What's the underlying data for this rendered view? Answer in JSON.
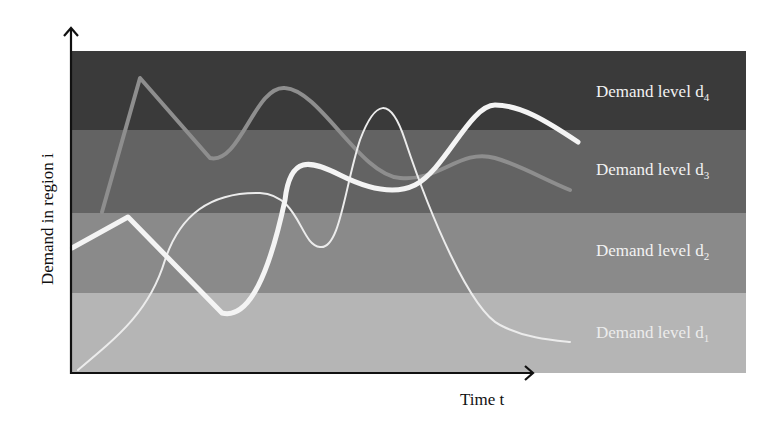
{
  "chart_data": {
    "type": "line",
    "title": "",
    "xlabel": "Time t",
    "ylabel": "Demand in region i",
    "grid": false,
    "legend": "none (bands labeled inline on right)",
    "bands": [
      {
        "id": "d4",
        "label": "Demand level",
        "sub": "4",
        "color": "#3a3a3a",
        "y_top": 51,
        "y_bottom": 130
      },
      {
        "id": "d3",
        "label": "Demand level",
        "sub": "3",
        "color": "#626262",
        "y_top": 130,
        "y_bottom": 213
      },
      {
        "id": "d2",
        "label": "Demand level",
        "sub": "2",
        "color": "#8a8a8a",
        "y_top": 213,
        "y_bottom": 293
      },
      {
        "id": "d1",
        "label": "Demand level",
        "sub": "1",
        "color": "#b4b4b4",
        "y_top": 293,
        "y_bottom": 373
      }
    ],
    "series": [
      {
        "name": "thick-white-curve",
        "stroke": "#f4f4f4",
        "width": 5,
        "path": "M72,248 L128,217 L222,313 C250,320 270,270 285,200 C290,155 310,160 340,175 C370,190 395,195 415,185 C445,170 470,105 495,105 C520,105 545,120 578,142"
      },
      {
        "name": "medium-gray-curve",
        "stroke": "#8e8e8e",
        "width": 4,
        "path": "M102,212 L140,78 L210,158 C240,165 255,85 285,88 C320,90 360,175 400,178 C440,182 460,148 495,158 C520,165 545,180 570,190"
      },
      {
        "name": "thin-white-curve-a",
        "stroke": "#ececec",
        "width": 2,
        "path": "M78,370 C120,335 150,310 165,260 C180,215 210,192 260,193 C300,195 300,245 320,247 C340,250 345,185 360,140 C375,100 390,95 405,140 C430,215 470,310 500,325 C525,338 550,340 570,342"
      }
    ],
    "axes": {
      "x_arrow_end": 535,
      "y_arrow_top": 28
    }
  },
  "labels": {
    "d4": "Demand level d",
    "d4_sub": "4",
    "d3": "Demand level d",
    "d3_sub": "3",
    "d2": "Demand level d",
    "d2_sub": "2",
    "d1": "Demand level d",
    "d1_sub": "1",
    "xlabel": "Time t",
    "ylabel": "Demand in region i"
  }
}
